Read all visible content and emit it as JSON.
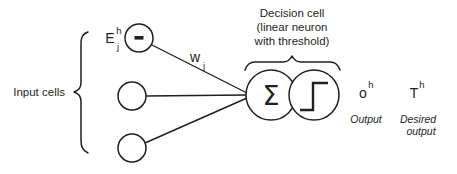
{
  "diagram": {
    "colors": {
      "ink": "#231f20",
      "background": "#ffffff"
    },
    "labels": {
      "input_cells": "Input cells",
      "decision_cell_line1": "Decision cell",
      "decision_cell_line2": "(linear neuron",
      "decision_cell_line3": "with threshold)",
      "output_caption": "Output",
      "desired_output_line1": "Desired",
      "desired_output_line2": "output"
    },
    "symbols": {
      "input_activation_base": "E",
      "input_activation_sup": "h",
      "input_activation_sub": "j",
      "weight_base": "w",
      "weight_sub": "j",
      "summation": "Σ",
      "output_base": "o",
      "output_sup": "h",
      "target_base": "T",
      "target_sup": "h"
    },
    "nodes": [
      {
        "name": "input-cell-top",
        "cx": 139,
        "cy": 38,
        "r": 14,
        "filled_marker": true,
        "label": "E"
      },
      {
        "name": "input-cell-middle",
        "cx": 132,
        "cy": 96,
        "r": 14,
        "filled_marker": false,
        "label": ""
      },
      {
        "name": "input-cell-bottom",
        "cx": 132,
        "cy": 148,
        "r": 14,
        "filled_marker": false,
        "label": ""
      },
      {
        "name": "summation-node",
        "cx": 271,
        "cy": 95,
        "r": 25,
        "filled_marker": false,
        "label": "Σ"
      },
      {
        "name": "threshold-node",
        "cx": 314,
        "cy": 95,
        "r": 25,
        "filled_marker": false,
        "label": "step"
      }
    ],
    "connections": [
      {
        "name": "edge-top-to-sum",
        "from": "input-cell-top",
        "to": "summation-node"
      },
      {
        "name": "edge-middle-to-sum",
        "from": "input-cell-middle",
        "to": "summation-node"
      },
      {
        "name": "edge-bottom-to-sum",
        "from": "input-cell-bottom",
        "to": "summation-node"
      },
      {
        "name": "edge-sum-to-threshold",
        "from": "summation-node",
        "to": "threshold-node"
      }
    ]
  }
}
